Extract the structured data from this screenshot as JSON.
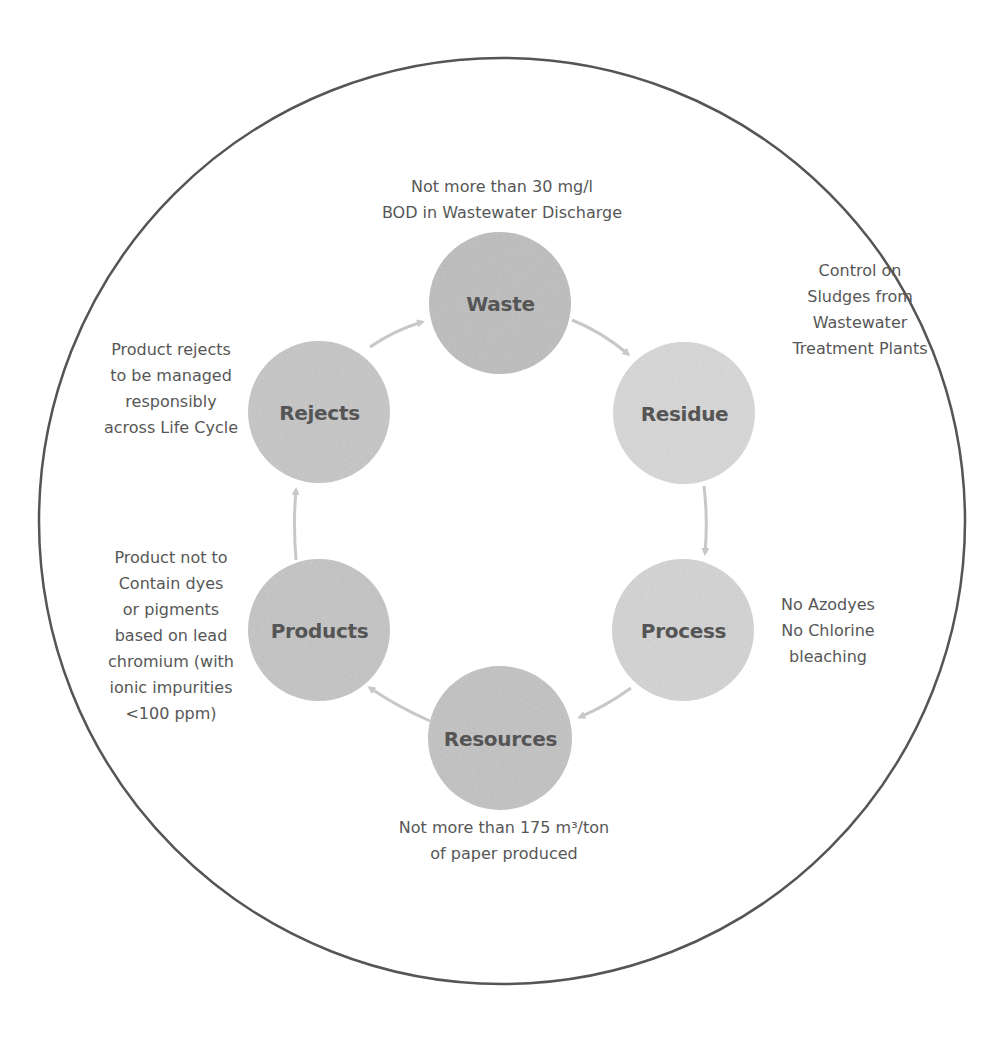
{
  "diagram": {
    "type": "cycle",
    "outer_circle": {
      "cx": 502,
      "cy": 521,
      "r": 463,
      "stroke": "#555555"
    },
    "colors": {
      "node_dark": "#bdbdbd",
      "node_light": "#d6d6d6",
      "arrow": "#c8c8c8",
      "label_text": "#555555",
      "note_text": "#575757"
    },
    "nodes": [
      {
        "id": "waste",
        "label": "Waste",
        "cx": 500,
        "cy": 303,
        "note": [
          "Not more than 30 mg/l",
          "BOD in Wastewater Discharge"
        ]
      },
      {
        "id": "residue",
        "label": "Residue",
        "cx": 684,
        "cy": 413,
        "note": [
          "Control on",
          "Sludges from",
          "Wastewater",
          "Treatment Plants"
        ]
      },
      {
        "id": "process",
        "label": "Process",
        "cx": 683,
        "cy": 630,
        "note": [
          "No Azodyes",
          "No Chlorine",
          "bleaching"
        ]
      },
      {
        "id": "resources",
        "label": "Resources",
        "cx": 500,
        "cy": 738,
        "note": [
          "Not more than 175 m³/ton",
          "of paper produced"
        ]
      },
      {
        "id": "products",
        "label": "Products",
        "cx": 319,
        "cy": 630,
        "note": [
          "Product not to",
          "Contain dyes",
          "or pigments",
          "based on lead",
          "chromium (with",
          "ionic impurities",
          "<100 ppm)"
        ]
      },
      {
        "id": "rejects",
        "label": "Rejects",
        "cx": 319,
        "cy": 412,
        "note": [
          "Product rejects",
          "to be managed",
          "responsibly",
          "across Life Cycle"
        ]
      }
    ],
    "edges": [
      {
        "from": "rejects",
        "to": "waste"
      },
      {
        "from": "waste",
        "to": "residue"
      },
      {
        "from": "residue",
        "to": "process"
      },
      {
        "from": "process",
        "to": "resources"
      },
      {
        "from": "resources",
        "to": "products"
      },
      {
        "from": "products",
        "to": "rejects"
      }
    ]
  }
}
